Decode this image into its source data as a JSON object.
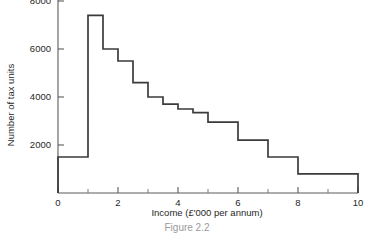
{
  "chart_data": {
    "type": "bar",
    "title": "",
    "xlabel": "Income (£'000 per annum)",
    "ylabel": "Number of tax units",
    "xlim": [
      0,
      10
    ],
    "ylim": [
      0,
      8800
    ],
    "grid": false,
    "legend": "none",
    "x_ticks": [
      0,
      2,
      4,
      6,
      8,
      10
    ],
    "x_tick_labels": [
      "0",
      "2",
      "4",
      "6",
      "8",
      "10"
    ],
    "x_minor_ticks": [
      1,
      3,
      5,
      7,
      9
    ],
    "y_ticks": [
      2000,
      4000,
      6000,
      8000
    ],
    "y_tick_labels": [
      "2000",
      "4000",
      "6000",
      "8000"
    ],
    "bins": [
      {
        "x0": 0,
        "x1": 1,
        "value": 1500
      },
      {
        "x0": 1,
        "x1": 1.5,
        "value": 7400
      },
      {
        "x0": 1.5,
        "x1": 2,
        "value": 6000
      },
      {
        "x0": 2,
        "x1": 2.5,
        "value": 5500
      },
      {
        "x0": 2.5,
        "x1": 3,
        "value": 4600
      },
      {
        "x0": 3,
        "x1": 3.5,
        "value": 4000
      },
      {
        "x0": 3.5,
        "x1": 4,
        "value": 3700
      },
      {
        "x0": 4,
        "x1": 4.5,
        "value": 3500
      },
      {
        "x0": 4.5,
        "x1": 5,
        "value": 3350
      },
      {
        "x0": 5,
        "x1": 6,
        "value": 2950
      },
      {
        "x0": 6,
        "x1": 7,
        "value": 2200
      },
      {
        "x0": 7,
        "x1": 8,
        "value": 1500
      },
      {
        "x0": 8,
        "x1": 10,
        "value": 800
      }
    ],
    "colors": {
      "line": "#3b3b3b",
      "axis": "#5a5a5a",
      "text": "#1f1f1f",
      "background": "#ffffff"
    }
  },
  "caption": {
    "text": "Figure 2.2"
  }
}
